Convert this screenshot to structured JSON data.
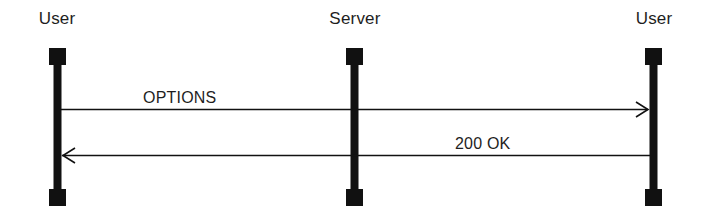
{
  "diagram": {
    "type": "sequence",
    "colors": {
      "line": "#111111",
      "text": "#1e1e1e",
      "background": "#ffffff"
    },
    "actors": [
      {
        "label": "User",
        "x": 57
      },
      {
        "label": "Server",
        "x": 354
      },
      {
        "label": "User",
        "x": 653
      }
    ],
    "messages": [
      {
        "label": "OPTIONS",
        "from": 0,
        "to": 2,
        "direction": "right",
        "y": 109
      },
      {
        "label": "200 OK",
        "from": 2,
        "to": 0,
        "direction": "left",
        "y": 155
      }
    ]
  }
}
